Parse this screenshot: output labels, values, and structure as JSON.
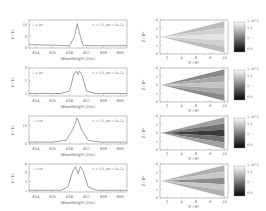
{
  "chart_data": [
    {
      "type": "line",
      "panel": "a",
      "annotation_left": "i = 20",
      "annotation_right": "n = 7.5, ρ0 = 5e-11",
      "xlabel": "Wavelength (nm)",
      "ylabel": "F / Fc",
      "xlim": [
        653.6,
        659.4
      ],
      "xticks": [
        654,
        655,
        656,
        657,
        658,
        659
      ],
      "ylim": [
        0,
        12
      ],
      "yticks": [
        0,
        5,
        10
      ],
      "x": [
        653.6,
        655.0,
        656.0,
        656.3,
        656.45,
        656.6,
        656.8,
        657.2,
        659.4
      ],
      "values": [
        1.4,
        1.2,
        1.0,
        5.0,
        10.5,
        6.0,
        1.2,
        1.0,
        1.0
      ]
    },
    {
      "type": "line",
      "panel": "b",
      "annotation_left": "i = 20",
      "annotation_right": "n = 3.5, ρ0 = 5e-11",
      "xlabel": "Wavelength (nm)",
      "ylabel": "F / Fc",
      "xlim": [
        653.6,
        659.4
      ],
      "xticks": [
        654,
        655,
        656,
        657,
        658,
        659
      ],
      "ylim": [
        0.8,
        3
      ],
      "yticks": [
        1,
        2,
        3
      ],
      "x": [
        653.6,
        655.5,
        656.0,
        656.25,
        656.4,
        656.5,
        656.6,
        656.75,
        657.0,
        657.5,
        659.4
      ],
      "values": [
        1.0,
        1.0,
        1.2,
        2.5,
        2.75,
        2.5,
        2.75,
        2.4,
        1.2,
        1.0,
        1.0
      ]
    },
    {
      "type": "line",
      "panel": "c",
      "annotation_left": "i = 60",
      "annotation_right": "n = 7.5, ρ0 = 5e-11",
      "xlabel": "Wavelength (nm)",
      "ylabel": "F / Fc",
      "xlim": [
        653.6,
        659.4
      ],
      "xticks": [
        654,
        655,
        656,
        657,
        658,
        659
      ],
      "ylim": [
        0,
        15
      ],
      "yticks": [
        0,
        10
      ],
      "x": [
        653.6,
        655.0,
        655.8,
        656.2,
        656.45,
        656.7,
        657.1,
        657.8,
        659.4
      ],
      "values": [
        1.0,
        1.0,
        2.0,
        8.0,
        14.0,
        8.0,
        2.0,
        1.0,
        1.0
      ]
    },
    {
      "type": "line",
      "panel": "d",
      "annotation_left": "i = 60",
      "annotation_right": "n = 3.5, ρ0 = 5e-11",
      "xlabel": "Wavelength (nm)",
      "ylabel": "F / Fc",
      "xlim": [
        653.6,
        659.4
      ],
      "xticks": [
        654,
        655,
        656,
        657,
        658,
        659
      ],
      "ylim": [
        0.8,
        4
      ],
      "yticks": [
        1,
        2,
        3,
        4
      ],
      "x": [
        653.6,
        655.5,
        655.9,
        656.2,
        656.35,
        656.5,
        656.65,
        656.8,
        657.1,
        657.6,
        659.4
      ],
      "values": [
        1.0,
        1.0,
        1.4,
        3.2,
        3.7,
        2.9,
        3.7,
        3.2,
        1.4,
        1.0,
        1.0
      ]
    },
    {
      "type": "heatmap",
      "panel": "e",
      "xlabel": "R / R*",
      "ylabel": "Z / R*",
      "xlim": [
        1,
        10.5
      ],
      "xticks": [
        2,
        4,
        6,
        8,
        10
      ],
      "ylim": [
        -4,
        4
      ],
      "yticks": [
        -4,
        -2,
        0,
        2,
        4
      ],
      "colorbar": {
        "label": "× 10^4",
        "ticks": [
          0.5,
          1,
          1.5
        ]
      }
    },
    {
      "type": "heatmap",
      "panel": "f",
      "xlabel": "R / R*",
      "ylabel": "Z / R*",
      "xlim": [
        1,
        10.5
      ],
      "xticks": [
        2,
        4,
        6,
        8,
        10
      ],
      "ylim": [
        -4,
        4
      ],
      "yticks": [
        -4,
        -2,
        0,
        2,
        4
      ],
      "colorbar": {
        "label": "× 10^4",
        "ticks": [
          0.5,
          1,
          1.5
        ]
      }
    },
    {
      "type": "heatmap",
      "panel": "g",
      "xlabel": "R / R*",
      "ylabel": "Z / R*",
      "xlim": [
        1,
        10.5
      ],
      "xticks": [
        2,
        4,
        6,
        8,
        10
      ],
      "ylim": [
        -4,
        4
      ],
      "yticks": [
        -4,
        -2,
        0,
        2,
        4
      ],
      "colorbar": {
        "label": "× 10^4",
        "ticks": [
          0.5,
          1,
          1.5
        ]
      }
    },
    {
      "type": "heatmap",
      "panel": "h",
      "xlabel": "R / R*",
      "ylabel": "Z / R*",
      "xlim": [
        1,
        10.5
      ],
      "xticks": [
        2,
        4,
        6,
        8,
        10
      ],
      "ylim": [
        -4,
        4
      ],
      "yticks": [
        -4,
        -2,
        0,
        2,
        4
      ],
      "colorbar": {
        "label": "× 10^4",
        "ticks": [
          0.5,
          1,
          1.5
        ]
      }
    }
  ]
}
